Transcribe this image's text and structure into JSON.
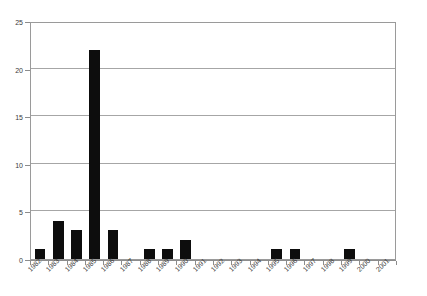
{
  "chart_data": {
    "type": "bar",
    "title": "",
    "subtitle": "",
    "xlabel": "",
    "ylabel": "",
    "categories": [
      "1982",
      "1983",
      "1984",
      "1985",
      "1986",
      "1987",
      "1988",
      "1989",
      "1990",
      "1991",
      "1992",
      "1993",
      "1994",
      "1995",
      "1996",
      "1997",
      "1998",
      "1999",
      "2000",
      "2001"
    ],
    "values": [
      1,
      4,
      3,
      22,
      3,
      0,
      1,
      1,
      2,
      0,
      0,
      0,
      0,
      1,
      1,
      0,
      0,
      1,
      0,
      0
    ],
    "ylim": [
      0,
      25
    ],
    "ytick_labels": [
      "0",
      "5",
      "10",
      "15",
      "20",
      "25"
    ],
    "ytick_values": [
      0,
      5,
      10,
      15,
      20,
      25
    ],
    "grid": "horizontal",
    "legend": "none",
    "series_color": "#0d0d0d",
    "gridline_color": "#a6a6a6",
    "axis_color": "#8c8c8c",
    "plot_background": "#ffffff"
  }
}
